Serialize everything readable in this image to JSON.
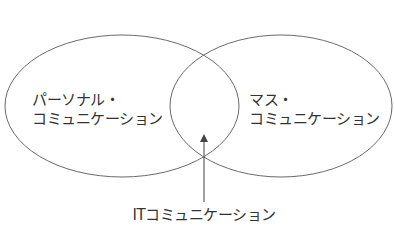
{
  "diagram": {
    "type": "venn",
    "sets": [
      {
        "id": "personal",
        "label_lines": [
          "パーソナル・",
          "コミュニケーション"
        ]
      },
      {
        "id": "mass",
        "label_lines": [
          "マス・",
          "コミュニケーション"
        ]
      }
    ],
    "intersection": {
      "label": "ITコミュニケーション",
      "pointer": "arrow"
    },
    "colors": {
      "stroke": "#6a6a6a",
      "text": "#333333",
      "background": "#ffffff"
    }
  }
}
